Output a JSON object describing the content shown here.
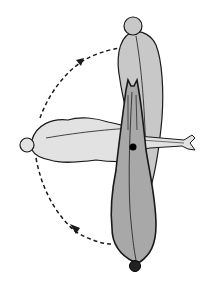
{
  "diagram": {
    "colors": {
      "background": "#ffffff",
      "upright_body_fill": "#c8c8c8",
      "horizontal_body_fill": "#e2e2e2",
      "front_body_fill": "#a8a8a8",
      "outline": "#1a1a1a",
      "arrow": "#1a1a1a"
    },
    "shapes": [
      {
        "id": "upright-body",
        "position": "back, top-right",
        "shade": "light gray"
      },
      {
        "id": "horizontal-body",
        "position": "middle, extends left and right",
        "shade": "lightest gray"
      },
      {
        "id": "front-body",
        "position": "front, center-bottom",
        "shade": "dark gray",
        "marker": "black dot"
      }
    ],
    "arrows": [
      {
        "id": "upper-arrow",
        "style": "dashed",
        "direction": "upward, clockwise toward top"
      },
      {
        "id": "lower-arrow",
        "style": "dashed",
        "direction": "toward left, from bottom"
      }
    ]
  }
}
